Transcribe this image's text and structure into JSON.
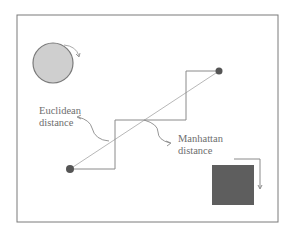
{
  "diagram": {
    "labels": {
      "euclidean_line1": "Euclidean",
      "euclidean_line2": "distance",
      "manhattan_line1": "Manhattan",
      "manhattan_line2": "distance"
    },
    "points": {
      "start": {
        "x": 70,
        "y": 169
      },
      "end": {
        "x": 219,
        "y": 71
      }
    },
    "shapes": {
      "circle": {
        "fill": "#cfcfcf",
        "stroke": "#7a7a7a"
      },
      "square": {
        "fill": "#5e5e5e"
      }
    },
    "colors": {
      "frame": "#7a7a7a",
      "euclidean_line": "#b8b8b8",
      "manhattan_path": "#8a8a8a",
      "dot": "#555555",
      "text": "#6e6e6e"
    }
  }
}
